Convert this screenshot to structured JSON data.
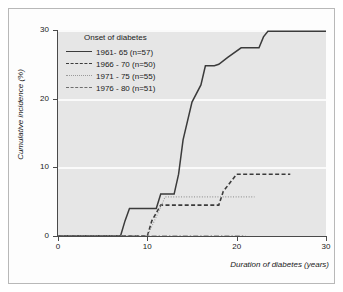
{
  "figure": {
    "background_color": "#ffffff",
    "plot_background_color": "#e6e6e6",
    "gridline_color": "#fafafa",
    "frame_color": "#b8b8b8"
  },
  "legend": {
    "title": "Onset of diabetes",
    "position": "top-left-inside",
    "entries": [
      {
        "label": "1961- 65 (n=57)",
        "style": "solid",
        "color": "#3b3b3b",
        "swatch": "legend-swatch-solid"
      },
      {
        "label": "1966 - 70 (n=50)",
        "style": "dashed",
        "color": "#3b3b3b",
        "swatch": "legend-swatch-dashed"
      },
      {
        "label": "1971 - 75 (n=55)",
        "style": "dotted",
        "color": "#9a9a9a",
        "swatch": "legend-swatch-dotted"
      },
      {
        "label": "1976 - 80 (n=51)",
        "style": "dashdot",
        "color": "#6e6e6e",
        "swatch": "legend-swatch-dashdot"
      }
    ]
  },
  "axes": {
    "x": {
      "title": "Duration of diabetes (years)",
      "ticks": [
        0,
        10,
        20,
        30
      ],
      "tick_labels": [
        "0",
        "10",
        "20",
        "30"
      ],
      "range": [
        0,
        30
      ]
    },
    "y": {
      "title": "Cumulative incidence (%)",
      "ticks": [
        0,
        10,
        20,
        30
      ],
      "tick_labels": [
        "0",
        "10",
        "20",
        "30"
      ],
      "range": [
        0,
        30
      ]
    }
  },
  "chart_data": {
    "type": "line",
    "title": "",
    "subtitle": "",
    "xlabel": "Duration of diabetes (years)",
    "ylabel": "Cumulative incidence (%)",
    "xlim": [
      0,
      30
    ],
    "ylim": [
      0,
      30
    ],
    "xticks": [
      0,
      10,
      20,
      30
    ],
    "yticks": [
      0,
      10,
      20,
      30
    ],
    "grid": true,
    "grid_orientation": "horizontal",
    "legend_title": "Onset of diabetes",
    "legend_position": "upper left (inside axes)",
    "interpolation": "step-like / piecewise linear (Kaplan-Meier style)",
    "series": [
      {
        "name": "1961- 65 (n=57)",
        "n": 57,
        "style": "solid",
        "color": "#3b3b3b",
        "x": [
          0,
          7,
          7.5,
          8,
          11,
          11.5,
          13,
          13.5,
          14,
          15,
          16,
          16.5,
          17.5,
          18,
          19,
          20.5,
          21,
          22.5,
          23,
          23.5,
          30
        ],
        "y": [
          0,
          0,
          2.2,
          4.0,
          4.0,
          6.1,
          6.1,
          9.0,
          14.0,
          19.5,
          22.0,
          24.8,
          24.8,
          25.0,
          26.0,
          27.4,
          27.4,
          27.4,
          29.0,
          29.8,
          29.8
        ]
      },
      {
        "name": "1966 - 70 (n=50)",
        "n": 50,
        "style": "dashed",
        "color": "#3b3b3b",
        "x": [
          0,
          10,
          10.5,
          11.5,
          18,
          18.5,
          20,
          26
        ],
        "y": [
          0,
          0,
          2.2,
          4.5,
          4.5,
          6.5,
          9.0,
          9.0
        ]
      },
      {
        "name": "1971 - 75 (n=55)",
        "n": 55,
        "style": "dotted",
        "color": "#9a9a9a",
        "x": [
          0,
          10,
          11,
          12,
          22
        ],
        "y": [
          0,
          0,
          2.8,
          5.7,
          5.7
        ]
      },
      {
        "name": "1976 - 80 (n=51)",
        "n": 51,
        "style": "dashdot",
        "color": "#6e6e6e",
        "x": [
          0,
          21
        ],
        "y": [
          0,
          0
        ]
      }
    ]
  }
}
